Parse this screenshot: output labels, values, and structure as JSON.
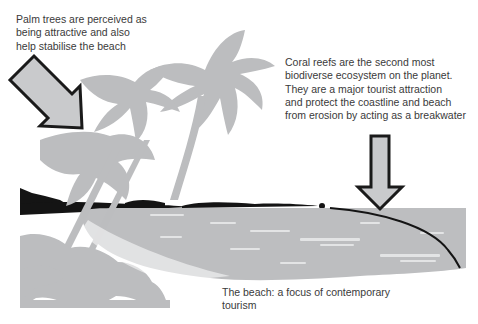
{
  "figure": {
    "colors": {
      "background": "#ffffff",
      "silhouette_gray": "#bcbdbf",
      "sea_gray": "#bdbec0",
      "wave_highlight": "#e6e7e8",
      "dark_land": "#141414",
      "arrow_fill": "#c9cacc",
      "arrow_outline": "#1a1a1a",
      "text": "#3a3a3a"
    },
    "annotations": {
      "palm_trees": {
        "lines": [
          "Palm trees are perceived as",
          "being attractive and also",
          "help stabilise the beach"
        ]
      },
      "coral_reefs": {
        "lines": [
          "Coral reefs are the second most",
          "biodiverse ecosystem on the planet.",
          "They are a major tourist attraction",
          "and protect the coastline and beach",
          "from erosion by acting as a breakwater"
        ]
      },
      "beach": {
        "lines": [
          "The beach: a focus of contemporary",
          "tourism"
        ]
      }
    },
    "icons": {
      "palm_arrow": "arrow-down-right-icon",
      "reef_arrow": "arrow-down-icon"
    }
  }
}
